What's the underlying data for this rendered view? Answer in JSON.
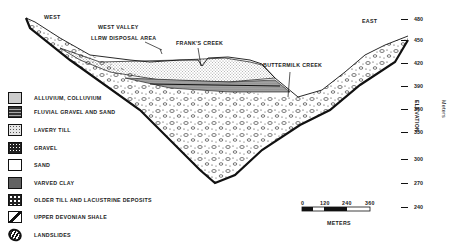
{
  "cross_section": {
    "west_label": "WEST",
    "east_label": "EAST",
    "site_label_line1": "WEST VALLEY",
    "site_label_line2": "LLRW DISPOSAL AREA",
    "franks_creek": "FRANK'S CREEK",
    "buttermilk_creek": "BUTTERMILK CREEK"
  },
  "legend": {
    "items": [
      {
        "label": "ALLUVIUM, COLLUVIUM",
        "pattern": "light-stipple"
      },
      {
        "label": "FLUVIAL GRAVEL AND SAND",
        "pattern": "horizontal-bands"
      },
      {
        "label": "LAVERY TILL",
        "pattern": "fine-dots"
      },
      {
        "label": "GRAVEL",
        "pattern": "dark-speckle"
      },
      {
        "label": "SAND",
        "pattern": "blank"
      },
      {
        "label": "VARVED CLAY",
        "pattern": "dense-speckle"
      },
      {
        "label": "OLDER TILL AND LACUSTRINE DEPOSITS",
        "pattern": "pebbles"
      },
      {
        "label": "UPPER DEVONIAN SHALE",
        "pattern": "diagonal-shale"
      },
      {
        "label": "LANDSLIDES",
        "pattern": "hatched-ellipse"
      }
    ]
  },
  "elevation_axis": {
    "title": "ELEVATION",
    "units": "Meters",
    "ticks": [
      "480",
      "450",
      "420",
      "390",
      "360",
      "330",
      "300",
      "270",
      "240"
    ]
  },
  "scale_bar": {
    "ticks": [
      "0",
      "120",
      "240",
      "360"
    ],
    "units": "METERS"
  }
}
